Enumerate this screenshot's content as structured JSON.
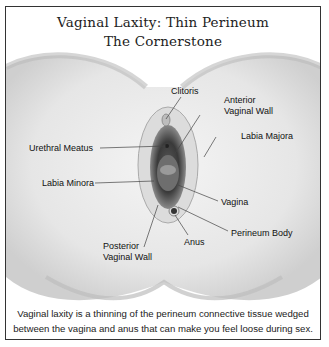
{
  "figure": {
    "title_line1": "Vaginal Laxity: Thin Perineum",
    "title_line2": "The Cornerstone",
    "caption_line1": "Vaginal laxity is a thinning of the perineum connective tissue wedged",
    "caption_line2": "between the vagina and anus that can make you feel loose during sex."
  },
  "labels": {
    "clitoris": "Clitoris",
    "anterior_vaginal_wall_1": "Anterior",
    "anterior_vaginal_wall_2": "Vaginal Wall",
    "labia_majora": "Labia Majora",
    "urethral_meatus": "Urethral Meatus",
    "labia_minora": "Labia Minora",
    "vagina": "Vagina",
    "perineum_body": "Perineum Body",
    "anus": "Anus",
    "posterior_vaginal_wall_1": "Posterior",
    "posterior_vaginal_wall_2": "Vaginal Wall"
  },
  "colors": {
    "frame": "#333333",
    "illustration_dark": "#3a3a3a",
    "illustration_light": "#d9d9d9",
    "text": "#111111"
  }
}
